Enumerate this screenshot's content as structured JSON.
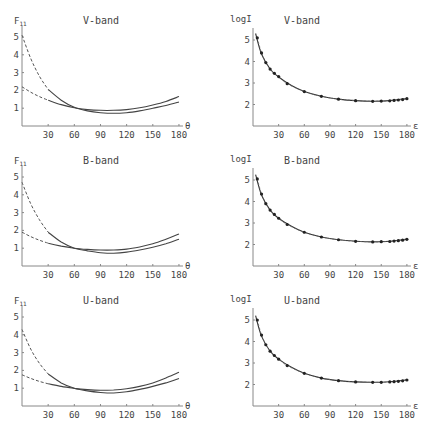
{
  "chart_data": [
    {
      "type": "line",
      "title": "V-band",
      "ylabel": "F11",
      "xlabel": "θ",
      "xlim": [
        0,
        180
      ],
      "ylim": [
        0,
        5.5
      ],
      "xticks": [
        30,
        60,
        90,
        120,
        150,
        180
      ],
      "yticks": [
        1,
        2,
        3,
        4,
        5
      ],
      "series": [
        {
          "name": "upper curve (dashed below 30°)",
          "x": [
            0,
            10,
            20,
            30,
            45,
            60,
            75,
            90,
            105,
            120,
            135,
            150,
            165,
            180
          ],
          "values": [
            5.1,
            3.8,
            2.8,
            2.05,
            1.45,
            1.05,
            0.85,
            0.75,
            0.72,
            0.75,
            0.85,
            1.0,
            1.15,
            1.35
          ],
          "dashed_until": 30
        },
        {
          "name": "lower curve (dashed below 30°)",
          "x": [
            0,
            10,
            20,
            30,
            45,
            60,
            75,
            90,
            105,
            120,
            135,
            150,
            165,
            180
          ],
          "values": [
            2.2,
            1.9,
            1.65,
            1.45,
            1.2,
            1.02,
            0.92,
            0.88,
            0.88,
            0.92,
            1.02,
            1.18,
            1.38,
            1.65
          ],
          "dashed_until": 30
        }
      ]
    },
    {
      "type": "scatter",
      "title": "V-band",
      "ylabel": "logI",
      "xlabel": "ε",
      "xlim": [
        0,
        180
      ],
      "ylim": [
        1,
        5.5
      ],
      "xticks": [
        30,
        60,
        90,
        120,
        150,
        180
      ],
      "yticks": [
        2,
        3,
        4,
        5
      ],
      "series": [
        {
          "name": "observed",
          "x": [
            5,
            10,
            15,
            20,
            25,
            30,
            40,
            60,
            80,
            100,
            120,
            140,
            150,
            160,
            165,
            170,
            175,
            180
          ],
          "values": [
            5.1,
            4.4,
            3.95,
            3.65,
            3.45,
            3.3,
            2.97,
            2.6,
            2.38,
            2.25,
            2.18,
            2.15,
            2.16,
            2.17,
            2.19,
            2.21,
            2.23,
            2.27
          ]
        },
        {
          "name": "model fit",
          "x": [
            3,
            10,
            20,
            30,
            45,
            60,
            80,
            100,
            120,
            140,
            160,
            180
          ],
          "values": [
            5.3,
            4.35,
            3.65,
            3.28,
            2.88,
            2.6,
            2.38,
            2.25,
            2.18,
            2.15,
            2.18,
            2.28
          ]
        }
      ]
    },
    {
      "type": "line",
      "title": "B-band",
      "ylabel": "F11",
      "xlabel": "θ",
      "xlim": [
        0,
        180
      ],
      "ylim": [
        0,
        5.5
      ],
      "xticks": [
        30,
        60,
        90,
        120,
        150,
        180
      ],
      "yticks": [
        1,
        2,
        3,
        4,
        5
      ],
      "series": [
        {
          "name": "upper curve (dashed below 30°)",
          "x": [
            0,
            10,
            20,
            30,
            45,
            60,
            75,
            90,
            105,
            120,
            135,
            150,
            165,
            180
          ],
          "values": [
            4.7,
            3.5,
            2.6,
            1.9,
            1.35,
            1.0,
            0.85,
            0.75,
            0.72,
            0.78,
            0.9,
            1.05,
            1.25,
            1.5
          ],
          "dashed_until": 30
        },
        {
          "name": "lower curve (dashed below 30°)",
          "x": [
            0,
            10,
            20,
            30,
            45,
            60,
            75,
            90,
            105,
            120,
            135,
            150,
            165,
            180
          ],
          "values": [
            1.9,
            1.65,
            1.45,
            1.28,
            1.12,
            1.0,
            0.93,
            0.9,
            0.9,
            0.95,
            1.07,
            1.25,
            1.5,
            1.8
          ],
          "dashed_until": 30
        }
      ]
    },
    {
      "type": "scatter",
      "title": "B-band",
      "ylabel": "logI",
      "xlabel": "ε",
      "xlim": [
        0,
        180
      ],
      "ylim": [
        1,
        5.5
      ],
      "xticks": [
        30,
        60,
        90,
        120,
        150,
        180
      ],
      "yticks": [
        2,
        3,
        4,
        5
      ],
      "series": [
        {
          "name": "observed",
          "x": [
            5,
            10,
            15,
            20,
            25,
            30,
            40,
            60,
            80,
            100,
            120,
            140,
            150,
            160,
            165,
            170,
            175,
            180
          ],
          "values": [
            5.05,
            4.35,
            3.9,
            3.6,
            3.4,
            3.22,
            2.93,
            2.57,
            2.35,
            2.22,
            2.15,
            2.12,
            2.13,
            2.14,
            2.16,
            2.18,
            2.2,
            2.24
          ]
        },
        {
          "name": "model fit",
          "x": [
            3,
            10,
            20,
            30,
            45,
            60,
            80,
            100,
            120,
            140,
            160,
            180
          ],
          "values": [
            5.25,
            4.3,
            3.6,
            3.22,
            2.85,
            2.57,
            2.35,
            2.22,
            2.15,
            2.12,
            2.15,
            2.25
          ]
        }
      ]
    },
    {
      "type": "line",
      "title": "U-band",
      "ylabel": "F11",
      "xlabel": "θ",
      "xlim": [
        0,
        180
      ],
      "ylim": [
        0,
        5.5
      ],
      "xticks": [
        30,
        60,
        90,
        120,
        150,
        180
      ],
      "yticks": [
        1,
        2,
        3,
        4,
        5
      ],
      "series": [
        {
          "name": "upper curve (dashed below 30°)",
          "x": [
            0,
            10,
            20,
            30,
            45,
            60,
            75,
            90,
            105,
            120,
            135,
            150,
            165,
            180
          ],
          "values": [
            4.3,
            3.2,
            2.4,
            1.8,
            1.3,
            1.0,
            0.85,
            0.76,
            0.73,
            0.8,
            0.93,
            1.1,
            1.3,
            1.55
          ],
          "dashed_until": 30
        },
        {
          "name": "lower curve (dashed below 30°)",
          "x": [
            0,
            10,
            20,
            30,
            45,
            60,
            75,
            90,
            105,
            120,
            135,
            150,
            165,
            180
          ],
          "values": [
            1.75,
            1.55,
            1.38,
            1.25,
            1.1,
            0.99,
            0.92,
            0.88,
            0.9,
            0.97,
            1.1,
            1.3,
            1.58,
            1.9
          ],
          "dashed_until": 30
        }
      ]
    },
    {
      "type": "scatter",
      "title": "U-band",
      "ylabel": "logI",
      "xlabel": "ε",
      "xlim": [
        0,
        180
      ],
      "ylim": [
        1,
        5.5
      ],
      "xticks": [
        30,
        60,
        90,
        120,
        150,
        180
      ],
      "yticks": [
        2,
        3,
        4,
        5
      ],
      "series": [
        {
          "name": "observed",
          "x": [
            5,
            10,
            15,
            20,
            25,
            30,
            40,
            60,
            80,
            100,
            120,
            140,
            150,
            160,
            165,
            170,
            175,
            180
          ],
          "values": [
            5.0,
            4.3,
            3.85,
            3.55,
            3.35,
            3.18,
            2.88,
            2.52,
            2.3,
            2.18,
            2.12,
            2.1,
            2.1,
            2.12,
            2.13,
            2.15,
            2.17,
            2.21
          ]
        },
        {
          "name": "model fit",
          "x": [
            3,
            10,
            20,
            30,
            45,
            60,
            80,
            100,
            120,
            140,
            160,
            180
          ],
          "values": [
            5.2,
            4.25,
            3.55,
            3.18,
            2.8,
            2.52,
            2.3,
            2.18,
            2.12,
            2.1,
            2.13,
            2.22
          ]
        }
      ]
    }
  ]
}
